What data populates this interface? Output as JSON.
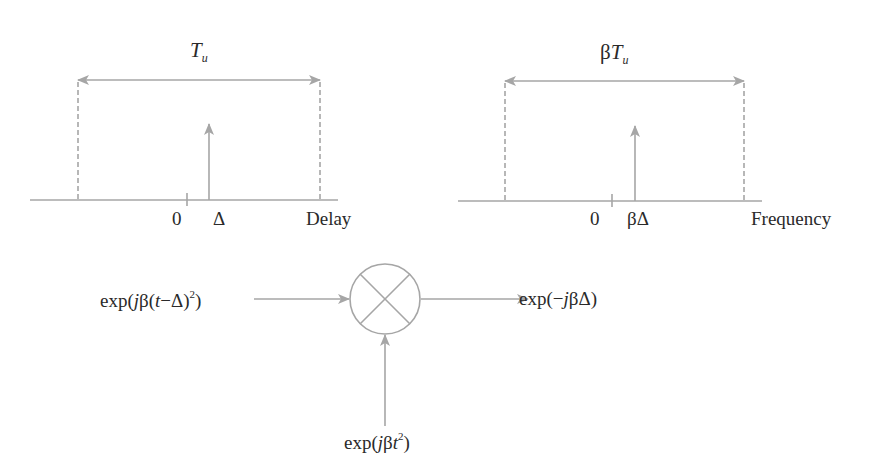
{
  "colors": {
    "line": "#a6a6a6",
    "text": "#2a2a2a",
    "background": "#ffffff"
  },
  "delay_plot": {
    "span_label": {
      "main": "T",
      "sub": "u"
    },
    "tick_zero": "0",
    "impulse_label": "Δ",
    "axis_label": "Delay"
  },
  "frequency_plot": {
    "span_label": {
      "prefix": "β",
      "main": "T",
      "sub": "u"
    },
    "tick_zero": "0",
    "impulse_label": "βΔ",
    "axis_label": "Frequency"
  },
  "mixer": {
    "input_left": {
      "pre": "exp(",
      "j": "j",
      "beta": "β(",
      "t": "t",
      "rest": "−Δ)",
      "exp": "2",
      "close": ")"
    },
    "input_bottom": {
      "pre": "exp(",
      "j": "j",
      "beta": "β",
      "t": "t",
      "exp": "2",
      "close": ")"
    },
    "output": {
      "pre": "exp(−",
      "j": "j",
      "rest": "βΔ)"
    },
    "symbol": "multiplier-circle-cross"
  }
}
